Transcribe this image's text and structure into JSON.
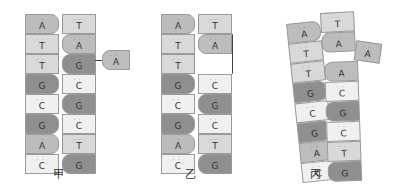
{
  "panels": [
    {
      "label": "甲",
      "left_strand": [
        "A",
        "T",
        "T",
        "G",
        "C",
        "G",
        "A",
        "C"
      ],
      "right_strand": [
        "T",
        "A",
        "G",
        "C",
        "G",
        "C",
        "T",
        "G"
      ],
      "free_nucleotide": "A"
    },
    {
      "label": "乙",
      "left_strand": [
        "A",
        "T",
        "T",
        "G",
        "C",
        "G",
        "A",
        "C"
      ],
      "right_strand": [
        "T",
        "A",
        "",
        "C",
        "G",
        "C",
        "T",
        "G"
      ],
      "note": "right strand missing base opposite third position"
    },
    {
      "label": "丙",
      "left_strand": [
        "A",
        "T",
        "T",
        "G",
        "C",
        "G",
        "A",
        "C"
      ],
      "right_strand": [
        "T",
        "A",
        "A",
        "C",
        "G",
        "C",
        "T",
        "G"
      ],
      "free_nucleotide": "A"
    }
  ],
  "colors": {
    "A": "#bdbdbd",
    "T": "#d9d9d9",
    "G": "#8f8f8f",
    "C": "#f0f0f0",
    "border": "#9a9a9a"
  }
}
